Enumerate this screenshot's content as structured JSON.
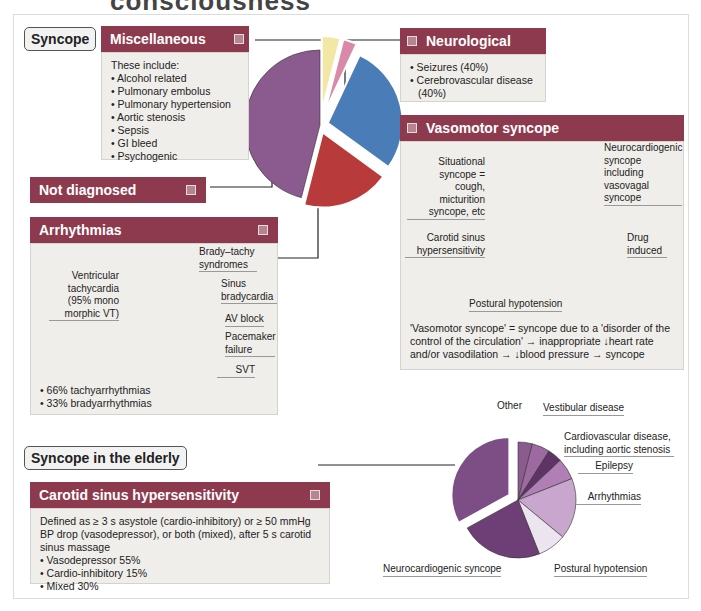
{
  "page_title_cut": "consciousness",
  "tags": {
    "syncope": "Syncope",
    "elderly": "Syncope in the elderly"
  },
  "misc": {
    "title": "Miscellaneous causes",
    "intro": "These include:",
    "items": [
      "Alcohol related",
      "Pulmonary embolus",
      "Pulmonary hypertension",
      "Aortic stenosis",
      "Sepsis",
      "GI bleed",
      "Psychogenic"
    ]
  },
  "neuro": {
    "title": "Neurological causes",
    "items": [
      "Seizures (40%)",
      "Cerebrovascular disease (40%)"
    ]
  },
  "not_diagnosed": {
    "title": "Not diagnosed"
  },
  "vasomotor": {
    "title": "Vasomotor syncope",
    "labels": {
      "situational": "Situational syncope = cough, micturition syncope, etc",
      "neuro": "Neurocardiogenic syncope including vasovagal syncope",
      "carotid": "Carotid sinus hypersensitivity",
      "drug": "Drug induced",
      "postural": "Postural hypotension"
    },
    "note": "'Vasomotor syncope' = syncope due to a 'disorder of the control of the circulation' → inappropriate ↓heart rate and/or vasodilation → ↓blood pressure → syncope"
  },
  "arrhythmias": {
    "title": "Arrhythmias",
    "labels": {
      "vt": "Ventricular tachycardia (95% mono morphic VT)",
      "brady_tachy": "Brady–tachy syndromes",
      "sinus": "Sinus bradycardia",
      "av": "AV block",
      "pacemaker": "Pacemaker failure",
      "svt": "SVT"
    },
    "stats": [
      "66% tachyarrhythmias",
      "33% bradyarrhythmias"
    ]
  },
  "carotid": {
    "title": "Carotid sinus hypersensitivity",
    "definition": "Defined as ≥ 3 s asystole (cardio-inhibitory) or ≥ 50 mmHg BP drop (vasodepressor), or both (mixed), after 5 s carotid sinus massage",
    "items": [
      "Vasodepressor 55%",
      "Cardio-inhibitory 15%",
      "Mixed 30%"
    ]
  },
  "elderly_labels": {
    "other": "Other",
    "vestibular": "Vestibular disease",
    "cardio": "Cardiovascular disease, including aortic stenosis",
    "epilepsy": "Epilepsy",
    "arrhythmias": "Arrhythmias",
    "postural": "Postural hypotension",
    "neurocardiogenic": "Neurocardiogenic syncope"
  },
  "colors": {
    "header": "#8e3a4e",
    "box": "#f0eeea"
  },
  "chart_data": [
    {
      "type": "pie",
      "title": "Syncope causes",
      "cx": 320,
      "cy": 125,
      "r": 75,
      "slices": [
        {
          "name": "Miscellaneous causes",
          "value": 4,
          "color": "#f3e7a6",
          "explode": 14
        },
        {
          "name": "Neurological causes",
          "value": 3,
          "color": "#d98aa8",
          "explode": 14
        },
        {
          "name": "Vasomotor syncope",
          "value": 28,
          "color": "#4a7cb8",
          "explode": 8
        },
        {
          "name": "Arrhythmias",
          "value": 19,
          "color": "#b83a3a",
          "explode": 8
        },
        {
          "name": "Not diagnosed",
          "value": 46,
          "color": "#8b5a8f",
          "explode": 0
        }
      ]
    },
    {
      "type": "pie",
      "title": "Vasomotor syncope",
      "cx": 543,
      "cy": 232,
      "r": 58,
      "slices": [
        {
          "name": "Neurocardiogenic",
          "value": 29,
          "color": "#3b6aa3"
        },
        {
          "name": "Drug induced",
          "value": 7,
          "color": "#2d4f7d"
        },
        {
          "name": "Postural hypotension",
          "value": 37,
          "color": "#5a86c0"
        },
        {
          "name": "Carotid sinus hypersensitivity",
          "value": 3,
          "color": "#e8eef6"
        },
        {
          "name": "Situational",
          "value": 24,
          "color": "#7fa2d0"
        }
      ]
    },
    {
      "type": "pie",
      "title": "Arrhythmias",
      "cx": 161,
      "cy": 320,
      "r": 60,
      "slices": [
        {
          "name": "Brady–tachy syndromes",
          "value": 19,
          "color": "#b8474e"
        },
        {
          "name": "Sinus bradycardia",
          "value": 4,
          "color": "#8a2a30"
        },
        {
          "name": "AV block",
          "value": 9,
          "color": "#a0333a"
        },
        {
          "name": "Pacemaker failure",
          "value": 3,
          "color": "#f4f0f0"
        },
        {
          "name": "SVT",
          "value": 9,
          "color": "#e49aa0"
        },
        {
          "name": "Ventricular tachycardia",
          "value": 56,
          "color": "#d0626a"
        }
      ]
    },
    {
      "type": "pie",
      "title": "Syncope in the elderly",
      "cx": 518,
      "cy": 500,
      "r": 58,
      "slices": [
        {
          "name": "Other",
          "value": 4,
          "color": "#8b5a8f"
        },
        {
          "name": "Vestibular disease",
          "value": 5,
          "color": "#9c6aa0"
        },
        {
          "name": "Cardiovascular disease",
          "value": 4,
          "color": "#5e3466"
        },
        {
          "name": "Epilepsy",
          "value": 6,
          "color": "#b07fb5"
        },
        {
          "name": "Arrhythmias",
          "value": 17,
          "color": "#c9a6cd"
        },
        {
          "name": "Postural hypotension",
          "value": 8,
          "color": "#ece4ee"
        },
        {
          "name": "Neurocardiogenic syncope",
          "value": 23,
          "color": "#6e3f76"
        },
        {
          "name": "Carotid sinus hypersensitivity",
          "value": 33,
          "color": "#7d4e86",
          "explode": 10
        }
      ]
    }
  ]
}
